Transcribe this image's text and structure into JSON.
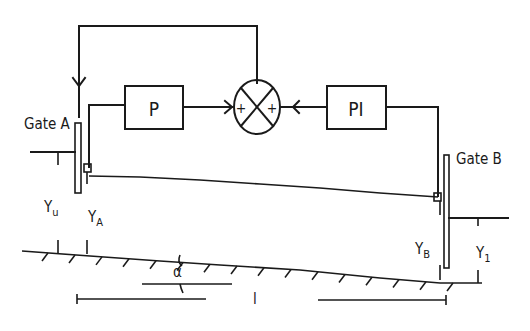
{
  "diagram": {
    "type": "control-block-diagram",
    "blocks": {
      "p_controller": "P",
      "pi_controller": "PI",
      "summing_junction": {
        "inputs": [
          "+",
          "+"
        ]
      }
    },
    "gates": {
      "gate_a": "Gate A",
      "gate_b": "Gate B"
    },
    "depths": {
      "upstream": {
        "main": "Y",
        "sub": "u"
      },
      "at_a": {
        "main": "Y",
        "sub": "A"
      },
      "at_b": {
        "main": "Y",
        "sub": "B"
      },
      "downstream": {
        "main": "Y",
        "sub": "1"
      }
    },
    "slope_angle": "α",
    "reach_length": "l",
    "connections": [
      {
        "from": "sensor at Gate A",
        "to": "P"
      },
      {
        "from": "P",
        "to": "summing_junction",
        "sign": "+"
      },
      {
        "from": "sensor at Gate B",
        "to": "PI"
      },
      {
        "from": "PI",
        "to": "summing_junction",
        "sign": "+"
      },
      {
        "from": "summing_junction",
        "to": "Gate A"
      }
    ]
  }
}
